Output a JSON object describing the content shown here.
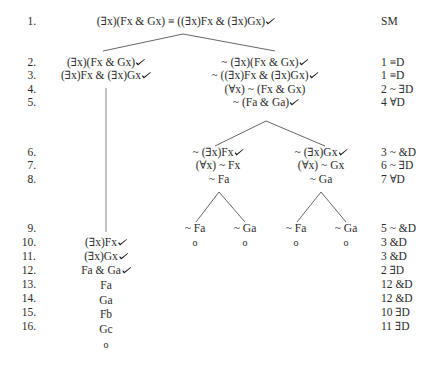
{
  "tree": {
    "line_numbers": [
      "1.",
      "2.",
      "3.",
      "4.",
      "5.",
      "6.",
      "7.",
      "8.",
      "9.",
      "10.",
      "11.",
      "12.",
      "13.",
      "14.",
      "15.",
      "16."
    ],
    "justifications": [
      "SM",
      "1 ≡D",
      "1 ≡D",
      "2 ~ ∃D",
      "4 ∀D",
      "3 ~ &D",
      "6 ~ ∃D",
      "7 ∀D",
      "5 ~ &D",
      "3 &D",
      "3 &D",
      "2 ∃D",
      "12 &D",
      "12 &D",
      "10 ∃D",
      "11 ∃D"
    ],
    "root": {
      "formula": "(∃x)(Fx & Gx) ≡ ((∃x)Fx & (∃x)Gx)",
      "checked": true
    },
    "left_branch": {
      "lines": [
        {
          "row": 2,
          "formula": "(∃x)(Fx & Gx)",
          "checked": true
        },
        {
          "row": 3,
          "formula": "(∃x)Fx & (∃x)Gx",
          "checked": true
        },
        {
          "row": 10,
          "formula": "(∃x)Fx",
          "checked": true
        },
        {
          "row": 11,
          "formula": "(∃x)Gx",
          "checked": true
        },
        {
          "row": 12,
          "formula": "Fa & Ga",
          "checked": true
        },
        {
          "row": 13,
          "formula": "Fa",
          "checked": false
        },
        {
          "row": 14,
          "formula": "Ga",
          "checked": false
        },
        {
          "row": 15,
          "formula": "Fb",
          "checked": false
        },
        {
          "row": 16,
          "formula": "Gc",
          "checked": false
        }
      ],
      "terminal": "o"
    },
    "right_branch": {
      "lines": [
        {
          "row": 2,
          "formula": "~ (∃x)(Fx & Gx)",
          "checked": true
        },
        {
          "row": 3,
          "formula": "~ ((∃x)Fx & (∃x)Gx)",
          "checked": true
        },
        {
          "row": 4,
          "formula": "(∀x) ~ (Fx & Gx)",
          "checked": false
        },
        {
          "row": 5,
          "formula": "~ (Fa & Ga)",
          "checked": true
        }
      ],
      "sub_left": {
        "lines": [
          {
            "row": 6,
            "formula": "~ (∃x)Fx",
            "checked": true
          },
          {
            "row": 7,
            "formula": "(∀x) ~ Fx",
            "checked": false
          },
          {
            "row": 8,
            "formula": "~ Fa",
            "checked": false
          }
        ],
        "leaves": [
          {
            "row": 9,
            "formula": "~ Fa",
            "terminal": "o"
          },
          {
            "row": 9,
            "formula": "~ Ga",
            "terminal": "o"
          }
        ]
      },
      "sub_right": {
        "lines": [
          {
            "row": 6,
            "formula": "~ (∃x)Gx",
            "checked": true
          },
          {
            "row": 7,
            "formula": "(∀x) ~ Gx",
            "checked": false
          },
          {
            "row": 8,
            "formula": "~ Ga",
            "checked": false
          }
        ],
        "leaves": [
          {
            "row": 9,
            "formula": "~ Fa",
            "terminal": "o"
          },
          {
            "row": 9,
            "formula": "~ Ga",
            "terminal": "o"
          }
        ]
      }
    },
    "colors": {
      "text": "#2b2b2b",
      "lines": "#555555",
      "check_mark": "#1a1a1a"
    }
  }
}
